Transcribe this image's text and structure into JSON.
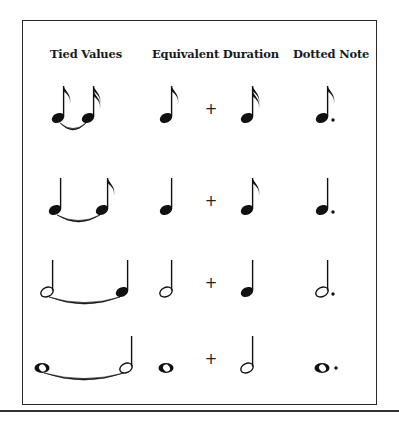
{
  "headers": {
    "tied": "Tied Values",
    "equivalent": "Equivalent Duration",
    "dotted": "Dotted Note"
  },
  "operator": "+",
  "rows": [
    {
      "name": "dotted-eighth",
      "tied": [
        "eighth",
        "sixteenth"
      ],
      "equivalent": [
        "eighth",
        "sixteenth"
      ],
      "dotted": "dotted-eighth"
    },
    {
      "name": "dotted-quarter",
      "tied": [
        "quarter",
        "eighth"
      ],
      "equivalent": [
        "quarter",
        "eighth"
      ],
      "dotted": "dotted-quarter"
    },
    {
      "name": "dotted-half",
      "tied": [
        "half",
        "quarter"
      ],
      "equivalent": [
        "half",
        "quarter"
      ],
      "dotted": "dotted-half"
    },
    {
      "name": "dotted-whole",
      "tied": [
        "whole",
        "half"
      ],
      "equivalent": [
        "whole",
        "half"
      ],
      "dotted": "dotted-whole"
    }
  ]
}
